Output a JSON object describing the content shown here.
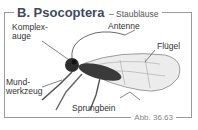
{
  "figure": {
    "title": "B. Psocoptera",
    "subtitle": "– Staubläuse",
    "caption": "Abb. 36.63"
  },
  "labels": {
    "compound_eye": "Komplex-\nauge",
    "antenna": "Antenne",
    "wing": "Flügel",
    "mouthparts": "Mund-\nwerkzeug",
    "jumping_leg": "Sprungbein"
  },
  "colors": {
    "title": "#3f4a5a",
    "border": "#9a9a9a",
    "caption": "#888888",
    "insect_dark": "#2e2e2e",
    "wing": "#e6e6e6"
  }
}
